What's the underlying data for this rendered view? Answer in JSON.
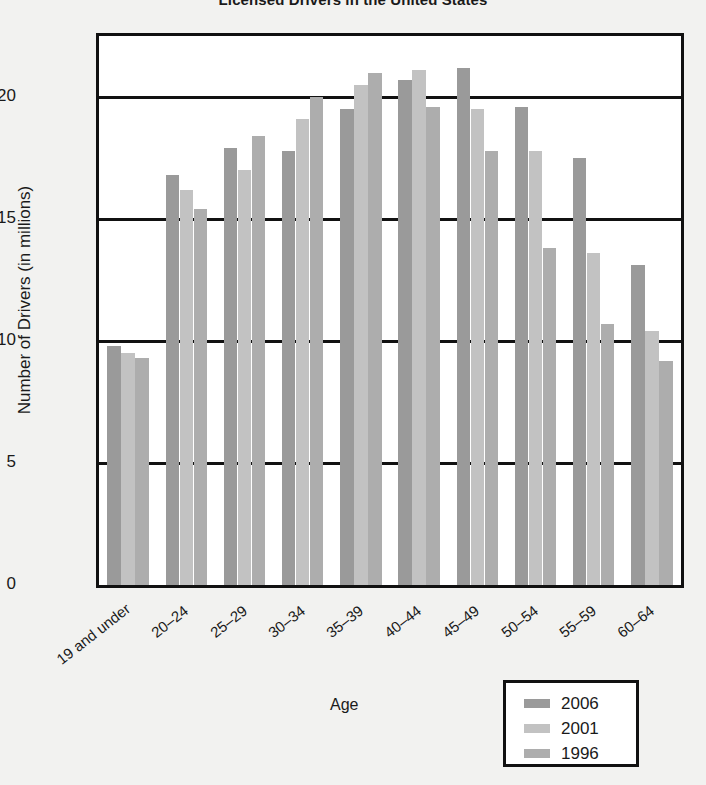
{
  "chart_data": {
    "type": "bar",
    "title": "Licensed Drivers in the United States",
    "xlabel": "Age",
    "ylabel": "Number of Drivers (in millions)",
    "ylim": [
      0,
      22.5
    ],
    "yticks": [
      0,
      5,
      10,
      15,
      20
    ],
    "ytick_labels": [
      "0",
      "5",
      "10",
      "15",
      "20"
    ],
    "grid": true,
    "legend_position": "bottom-right",
    "categories": [
      "19 and under",
      "20–24",
      "25–29",
      "30–34",
      "35–39",
      "40–44",
      "45–49",
      "50–54",
      "55–59",
      "60–64"
    ],
    "series": [
      {
        "name": "2006",
        "color": "#9a9a9a",
        "values": [
          9.8,
          16.8,
          17.9,
          17.8,
          19.5,
          20.7,
          21.2,
          19.6,
          17.5,
          13.1
        ]
      },
      {
        "name": "2001",
        "color": "#c2c2c2",
        "values": [
          9.5,
          16.2,
          17.0,
          19.1,
          20.5,
          21.1,
          19.5,
          17.8,
          13.6,
          10.4
        ]
      },
      {
        "name": "1996",
        "color": "#adadad",
        "values": [
          9.3,
          15.4,
          18.4,
          20.0,
          21.0,
          19.6,
          17.8,
          13.8,
          10.7,
          9.2
        ]
      }
    ]
  },
  "legend": {
    "items": [
      {
        "label": "2006",
        "color": "#9a9a9a"
      },
      {
        "label": "2001",
        "color": "#c2c2c2"
      },
      {
        "label": "1996",
        "color": "#adadad"
      }
    ]
  }
}
